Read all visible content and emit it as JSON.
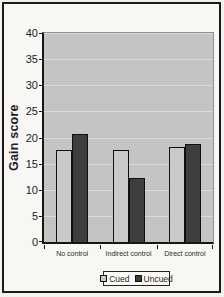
{
  "figure": {
    "paper_color": "#f8f7f4",
    "frame_border_color": "#1b1b1b"
  },
  "chart_data": {
    "type": "bar",
    "title": "",
    "xlabel": "",
    "ylabel": "Gain score",
    "categories": [
      "No control",
      "Indirect control",
      "Direct control"
    ],
    "series": [
      {
        "name": "Cued",
        "color": "#c9c9c9",
        "values": [
          17.7,
          17.6,
          18.2
        ]
      },
      {
        "name": "Uncued",
        "color": "#3e3e3e",
        "values": [
          20.7,
          12.2,
          18.7
        ]
      }
    ],
    "ylim": [
      0,
      40
    ],
    "yticks": [
      0,
      5,
      10,
      15,
      20,
      25,
      30,
      35,
      40
    ],
    "grid": true,
    "gridline_color": "#dadada",
    "plot_bg": "#c4c4c4",
    "legend_position": "bottom"
  }
}
